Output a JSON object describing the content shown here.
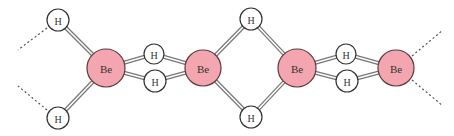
{
  "diagram": {
    "type": "molecular-structure",
    "colors": {
      "be_fill": "#f4a6b0",
      "be_stroke": "#5a3a3a",
      "h_fill": "#ffffff",
      "h_stroke": "#333333",
      "bond": "#777777",
      "dashed": "#555555"
    },
    "atoms": [
      {
        "id": "h1",
        "label": "H",
        "element": "H",
        "x": 58,
        "y": 20,
        "r": 11
      },
      {
        "id": "h2",
        "label": "H",
        "element": "H",
        "x": 58,
        "y": 118,
        "r": 11
      },
      {
        "id": "be1",
        "label": "Be",
        "element": "Be",
        "x": 106,
        "y": 68,
        "r": 19
      },
      {
        "id": "h3",
        "label": "H",
        "element": "H",
        "x": 154,
        "y": 54,
        "r": 10
      },
      {
        "id": "h4",
        "label": "H",
        "element": "H",
        "x": 155,
        "y": 81,
        "r": 11
      },
      {
        "id": "be2",
        "label": "Be",
        "element": "Be",
        "x": 203,
        "y": 68,
        "r": 18
      },
      {
        "id": "h5",
        "label": "H",
        "element": "H",
        "x": 251,
        "y": 19,
        "r": 11
      },
      {
        "id": "h6",
        "label": "H",
        "element": "H",
        "x": 251,
        "y": 117,
        "r": 11
      },
      {
        "id": "be3",
        "label": "Be",
        "element": "Be",
        "x": 297,
        "y": 68,
        "r": 19
      },
      {
        "id": "h7",
        "label": "H",
        "element": "H",
        "x": 346,
        "y": 54,
        "r": 10
      },
      {
        "id": "h8",
        "label": "H",
        "element": "H",
        "x": 347,
        "y": 81,
        "r": 11
      },
      {
        "id": "be4",
        "label": "Be",
        "element": "Be",
        "x": 396,
        "y": 68,
        "r": 18
      }
    ],
    "bonds": [
      {
        "from": "h1",
        "to": "be1"
      },
      {
        "from": "h2",
        "to": "be1"
      },
      {
        "from": "be1",
        "to": "h3"
      },
      {
        "from": "h3",
        "to": "be2"
      },
      {
        "from": "be1",
        "to": "h4"
      },
      {
        "from": "h4",
        "to": "be2"
      },
      {
        "from": "be2",
        "to": "h5"
      },
      {
        "from": "h5",
        "to": "be3"
      },
      {
        "from": "be2",
        "to": "h6"
      },
      {
        "from": "h6",
        "to": "be3"
      },
      {
        "from": "be3",
        "to": "h7"
      },
      {
        "from": "h7",
        "to": "be4"
      },
      {
        "from": "be3",
        "to": "h8"
      },
      {
        "from": "h8",
        "to": "be4"
      }
    ],
    "dashed_bonds": [
      {
        "x1": 47,
        "y1": 28,
        "x2": 18,
        "y2": 50
      },
      {
        "x1": 47,
        "y1": 110,
        "x2": 18,
        "y2": 86
      },
      {
        "x1": 412,
        "y1": 56,
        "x2": 443,
        "y2": 30
      },
      {
        "x1": 412,
        "y1": 80,
        "x2": 443,
        "y2": 106
      }
    ]
  }
}
